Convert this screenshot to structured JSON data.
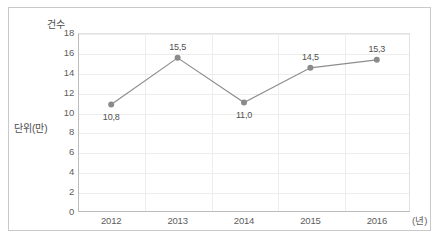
{
  "chart_data": {
    "type": "line",
    "title": "",
    "subtitle": "",
    "xlabel": "(년)",
    "ylabel": "건수",
    "unit_label": "단위(만)",
    "categories": [
      "2012",
      "2013",
      "2014",
      "2015",
      "2016"
    ],
    "values": [
      10.8,
      15.5,
      11.0,
      14.5,
      15.3
    ],
    "point_labels": [
      "10,8",
      "15,5",
      "11,0",
      "14,5",
      "15,3"
    ],
    "label_positions": [
      "below",
      "above",
      "below",
      "above",
      "above"
    ],
    "yticks": [
      18,
      16,
      14,
      12,
      10,
      8,
      6,
      4,
      2,
      0
    ],
    "ytick_labels": [
      "18",
      "16",
      "14",
      "12",
      "10",
      "8",
      "6",
      "4",
      "2",
      "0"
    ],
    "ylim": [
      0,
      18
    ],
    "grid": true,
    "legend": "none",
    "series": [
      {
        "name": "건수",
        "values": [
          10.8,
          15.5,
          11.0,
          14.5,
          15.3
        ]
      }
    ],
    "colors": {
      "line": "#8d8d8d",
      "marker": "#8a8a8a",
      "grid": "#ededed",
      "axis": "#bdbdbd",
      "text": "#5d5d5d",
      "frame": "#c9c9c9",
      "background": "#ffffff"
    }
  },
  "caption": ""
}
